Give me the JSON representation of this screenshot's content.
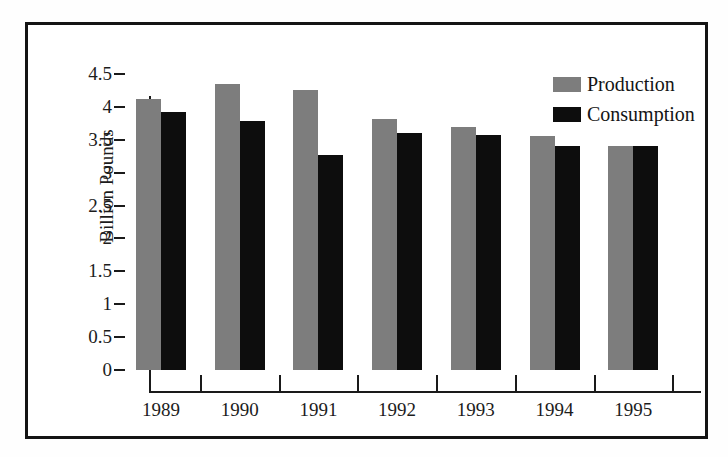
{
  "chart_data": {
    "type": "bar",
    "title": "",
    "xlabel": "",
    "ylabel": "Billion Pounds",
    "categories": [
      "1989",
      "1990",
      "1991",
      "1992",
      "1993",
      "1994",
      "1995"
    ],
    "series": [
      {
        "name": "Production",
        "color": "#7d7d7d",
        "values": [
          4.12,
          4.35,
          4.25,
          3.82,
          3.7,
          3.56,
          3.41
        ]
      },
      {
        "name": "Consumption",
        "color": "#0d0d0d",
        "values": [
          3.92,
          3.79,
          3.27,
          3.6,
          3.57,
          3.41,
          3.41
        ]
      }
    ],
    "ylim": [
      0,
      4.5
    ],
    "yticks": [
      "0",
      "0.5",
      "1",
      "1.5",
      "2",
      "2.5",
      "3",
      "3.5",
      "4",
      "4.5"
    ],
    "ytick_values": [
      0,
      0.5,
      1,
      1.5,
      2,
      2.5,
      3,
      3.5,
      4,
      4.5
    ],
    "grid": false,
    "legend_position": "top-right",
    "frame_color": "#141414",
    "axis_color": "#1a1a1a",
    "background": "#ffffff"
  },
  "legend": {
    "entries": [
      {
        "label": "Production",
        "color": "#7d7d7d"
      },
      {
        "label": "Consumption",
        "color": "#0d0d0d"
      }
    ]
  }
}
